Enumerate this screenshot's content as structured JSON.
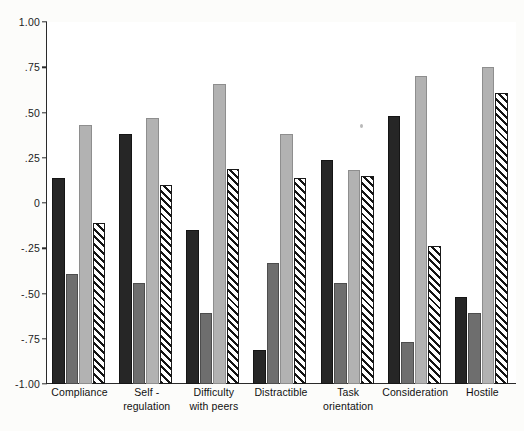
{
  "chart_data": {
    "type": "bar",
    "title": "",
    "subtitle": "",
    "xlabel": "",
    "ylabel": "",
    "ylim": [
      -1.0,
      1.0
    ],
    "grid": false,
    "legend": "none",
    "ytick_labels": [
      "1.00",
      ".75",
      ".50",
      ".25",
      "0",
      "-.25",
      "-.50",
      "-.75",
      "-1.00"
    ],
    "ytick_values": [
      1.0,
      0.75,
      0.5,
      0.25,
      0,
      -0.25,
      -0.5,
      -0.75,
      -1.0
    ],
    "categories": [
      "Compliance",
      "Self - regulation",
      "Difficulty with peers",
      "Distractible",
      "Task orientation",
      "Consideration",
      "Hostile"
    ],
    "category_lines": [
      [
        "Compliance"
      ],
      [
        "Self -",
        "regulation"
      ],
      [
        "Difficulty",
        "with peers"
      ],
      [
        "Distractible"
      ],
      [
        "Task",
        "orientation"
      ],
      [
        "Consideration"
      ],
      [
        "Hostile"
      ]
    ],
    "series": [
      {
        "name": "series-1",
        "style": "solid-black",
        "color": "#262626",
        "values": [
          0.14,
          0.38,
          -0.15,
          -0.81,
          0.24,
          0.48,
          -0.52
        ]
      },
      {
        "name": "series-2",
        "style": "solid-dark-gray",
        "color": "#6e6e6e",
        "values": [
          -0.39,
          -0.44,
          -0.61,
          -0.33,
          -0.44,
          -0.77,
          -0.61
        ]
      },
      {
        "name": "series-3",
        "style": "solid-light-gray",
        "color": "#b2b2b2",
        "values": [
          0.43,
          0.47,
          0.66,
          0.38,
          0.18,
          0.7,
          0.75
        ]
      },
      {
        "name": "series-4",
        "style": "diagonal-hatch",
        "color": "#ffffff",
        "values": [
          -0.11,
          0.1,
          0.19,
          0.14,
          0.15,
          -0.24,
          0.61
        ]
      }
    ]
  },
  "axis": {
    "ticks": [
      {
        "label": "1.00",
        "value": 1.0
      },
      {
        "label": ".75",
        "value": 0.75
      },
      {
        "label": ".50",
        "value": 0.5
      },
      {
        "label": ".25",
        "value": 0.25
      },
      {
        "label": "0",
        "value": 0
      },
      {
        "label": "-.25",
        "value": -0.25
      },
      {
        "label": "-.50",
        "value": -0.5
      },
      {
        "label": "-.75",
        "value": -0.75
      },
      {
        "label": "-1.00",
        "value": -1.0
      }
    ]
  }
}
